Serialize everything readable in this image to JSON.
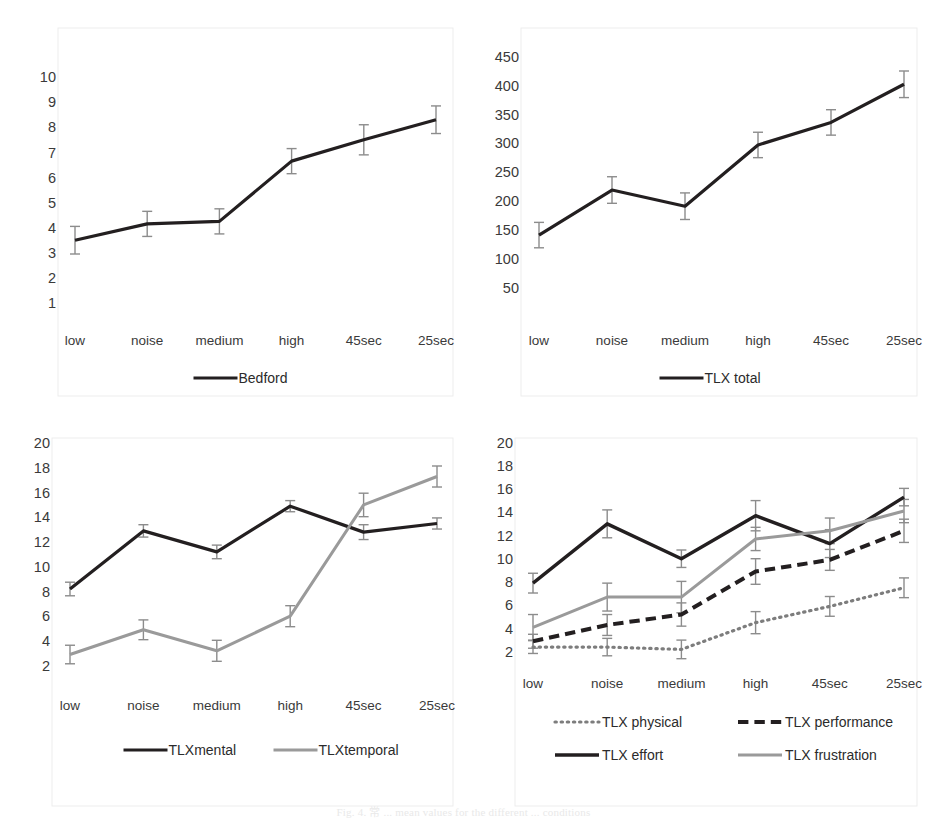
{
  "figure": {
    "caption": "Fig. 4.  常 ... mean values for the different ... conditions",
    "colors": {
      "dark": "#231f20",
      "gray": "#9a9a9a",
      "error_bar": "#8c8c8c",
      "frame": "#ededed",
      "text": "#3a3a3a",
      "background": "#ffffff"
    },
    "categories": [
      "low",
      "noise",
      "medium",
      "high",
      "45sec",
      "25sec"
    ]
  },
  "chart_data": [
    {
      "id": "bedford",
      "type": "line",
      "position": "top-left",
      "title": "",
      "xlabel": "",
      "ylabel": "",
      "categories": [
        "low",
        "noise",
        "medium",
        "high",
        "45sec",
        "25sec"
      ],
      "yticks": [
        10,
        9,
        8,
        7,
        6,
        5,
        4,
        3,
        2,
        1
      ],
      "ylim": [
        0.4,
        10.6
      ],
      "grid": false,
      "legend_position": "bottom",
      "series": [
        {
          "name": "Bedford",
          "style": "solid",
          "color": "#231f20",
          "width": 3.2,
          "values": [
            3.5,
            4.15,
            4.25,
            6.65,
            7.5,
            8.3
          ],
          "errors": [
            0.55,
            0.5,
            0.5,
            0.5,
            0.6,
            0.55
          ]
        }
      ]
    },
    {
      "id": "tlx-total",
      "type": "line",
      "position": "top-right",
      "title": "",
      "xlabel": "",
      "ylabel": "",
      "categories": [
        "low",
        "noise",
        "medium",
        "high",
        "45sec",
        "25sec"
      ],
      "yticks": [
        450,
        400,
        350,
        300,
        250,
        200,
        150,
        100,
        50
      ],
      "ylim": [
        20,
        470
      ],
      "grid": false,
      "legend_position": "bottom",
      "series": [
        {
          "name": "TLX total",
          "style": "solid",
          "color": "#231f20",
          "width": 3.2,
          "values": [
            141,
            219,
            191,
            297,
            336,
            402
          ],
          "errors": [
            22,
            23,
            23,
            22,
            22,
            23
          ]
        }
      ]
    },
    {
      "id": "tlx-mental-temporal",
      "type": "line",
      "position": "bottom-left",
      "title": "",
      "xlabel": "",
      "ylabel": "",
      "categories": [
        "low",
        "noise",
        "medium",
        "high",
        "45sec",
        "25sec"
      ],
      "yticks": [
        20,
        18,
        16,
        14,
        12,
        10,
        8,
        6,
        4,
        2
      ],
      "ylim": [
        1.0,
        20.9
      ],
      "grid": false,
      "legend_position": "bottom",
      "series": [
        {
          "name": "TLXmental",
          "style": "solid",
          "color": "#231f20",
          "width": 3.2,
          "values": [
            8.2,
            12.9,
            11.2,
            14.9,
            12.8,
            13.5
          ],
          "errors": [
            0.55,
            0.5,
            0.55,
            0.45,
            0.6,
            0.45
          ]
        },
        {
          "name": "TLXtemporal",
          "style": "solid",
          "color": "#9a9a9a",
          "width": 3.0,
          "values": [
            2.9,
            4.9,
            3.2,
            6.0,
            15.0,
            17.3
          ],
          "errors": [
            0.75,
            0.8,
            0.85,
            0.85,
            0.95,
            0.85
          ]
        }
      ]
    },
    {
      "id": "tlx-subscales",
      "type": "line",
      "position": "bottom-right",
      "title": "",
      "xlabel": "",
      "ylabel": "",
      "categories": [
        "low",
        "noise",
        "medium",
        "high",
        "45sec",
        "25sec"
      ],
      "yticks": [
        20,
        18,
        16,
        14,
        12,
        10,
        8,
        6,
        4,
        2
      ],
      "ylim": [
        0.6,
        20.9
      ],
      "grid": false,
      "legend_position": "bottom",
      "series": [
        {
          "name": "TLX physical",
          "style": "dotted",
          "color": "#7d7d7d",
          "width": 3.2,
          "values": [
            2.4,
            2.4,
            2.2,
            4.5,
            5.9,
            7.5
          ],
          "errors": [
            0.55,
            0.75,
            0.8,
            0.95,
            0.85,
            0.85
          ]
        },
        {
          "name": "TLX performance",
          "style": "dashed",
          "color": "#231f20",
          "width": 4.0,
          "values": [
            2.9,
            4.3,
            5.2,
            8.9,
            9.9,
            12.4
          ],
          "errors": [
            0.6,
            0.9,
            1.0,
            1.1,
            0.9,
            1.0
          ]
        },
        {
          "name": "TLX effort",
          "style": "solid",
          "color": "#231f20",
          "width": 3.4,
          "values": [
            7.9,
            13.0,
            10.0,
            13.7,
            11.3,
            15.3
          ],
          "errors": [
            0.85,
            1.2,
            0.75,
            1.3,
            1.2,
            0.75
          ]
        },
        {
          "name": "TLX frustration",
          "style": "solid",
          "color": "#9a9a9a",
          "width": 3.0,
          "values": [
            4.1,
            6.7,
            6.7,
            11.7,
            12.4,
            14.1
          ],
          "errors": [
            1.1,
            1.2,
            1.35,
            1.0,
            1.1,
            1.0
          ]
        }
      ]
    }
  ]
}
